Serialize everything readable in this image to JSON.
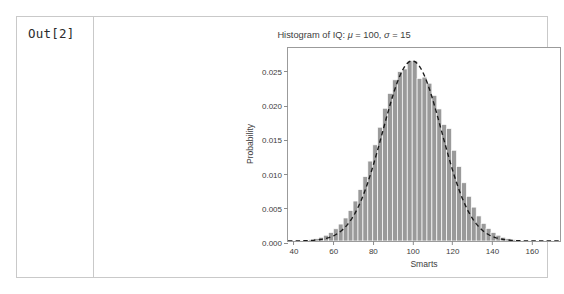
{
  "notebook": {
    "prompt": "Out[2]"
  },
  "chart_data": {
    "type": "bar",
    "title": "Histogram of IQ:  μ = 100,  σ = 15",
    "title_parts": {
      "prefix": "Histogram of IQ:  ",
      "mu_symbol": "μ",
      "mu_value": " = 100,  ",
      "sigma_symbol": "σ",
      "sigma_value": " = 15"
    },
    "xlabel": "Smarts",
    "ylabel": "Probability",
    "xlim": [
      37,
      175
    ],
    "ylim": [
      0,
      0.0285
    ],
    "xticks": [
      40,
      60,
      80,
      100,
      120,
      140,
      160
    ],
    "xtick_labels": [
      "40",
      "60",
      "80",
      "100",
      "120",
      "140",
      "160"
    ],
    "yticks": [
      0.0,
      0.005,
      0.01,
      0.015,
      0.02,
      0.025
    ],
    "ytick_labels": [
      "0.000",
      "0.005",
      "0.010",
      "0.015",
      "0.020",
      "0.025"
    ],
    "grid": false,
    "legend": null,
    "bar_color": "#9a9a9a",
    "bar_edge_color": "#ffffff",
    "curve_color": "#1a1a1a",
    "curve_style": "dashed",
    "bin_width": 2.5,
    "bin_starts": [
      45.0,
      47.5,
      50.0,
      52.5,
      55.0,
      57.5,
      60.0,
      62.5,
      65.0,
      67.5,
      70.0,
      72.5,
      75.0,
      77.5,
      80.0,
      82.5,
      85.0,
      87.5,
      90.0,
      92.5,
      95.0,
      97.5,
      100.0,
      102.5,
      105.0,
      107.5,
      110.0,
      112.5,
      115.0,
      117.5,
      120.0,
      122.5,
      125.0,
      127.5,
      130.0,
      132.5,
      135.0,
      137.5,
      140.0,
      142.5,
      145.0,
      147.5,
      150.0,
      152.5,
      155.0
    ],
    "bin_heights": [
      0.00012,
      0.0002,
      0.00034,
      0.00055,
      0.00085,
      0.00125,
      0.0018,
      0.0025,
      0.0034,
      0.0045,
      0.0059,
      0.0076,
      0.0095,
      0.0118,
      0.0142,
      0.0168,
      0.0196,
      0.0218,
      0.0238,
      0.025,
      0.0254,
      0.0266,
      0.0266,
      0.024,
      0.0242,
      0.0233,
      0.0215,
      0.0195,
      0.0172,
      0.0166,
      0.0134,
      0.011,
      0.0086,
      0.0066,
      0.005,
      0.0037,
      0.0026,
      0.00185,
      0.00125,
      0.00085,
      0.00055,
      0.00034,
      0.0002,
      0.00012,
      7e-05
    ],
    "curve": {
      "name": "normal pdf",
      "mu": 100,
      "sigma": 15,
      "peak": 0.0266
    }
  }
}
